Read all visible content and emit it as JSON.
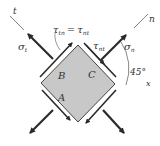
{
  "diagram": {
    "type": "stress-element",
    "axes": {
      "t": "t",
      "n": "n",
      "x": "x"
    },
    "stresses": {
      "sigma_t": "σ",
      "sigma_t_sub": "t",
      "sigma_n": "σ",
      "sigma_n_sub": "n",
      "tau_tn": "τ",
      "tau_tn_sub": "tn",
      "equals": "=",
      "tau_nt_1": "τ",
      "tau_nt_1_sub": "nt",
      "tau_nt_2": "τ",
      "tau_nt_2_sub": "nt"
    },
    "faces": {
      "A": "A",
      "B": "B",
      "C": "C"
    },
    "angle": "45°",
    "colors": {
      "element_fill": "#c8c8c8",
      "edge": "#333333",
      "arrow": "#2a2a2a"
    }
  }
}
